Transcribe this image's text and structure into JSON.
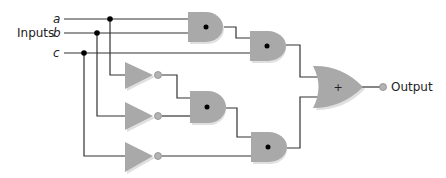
{
  "diagram": {
    "type": "logic-circuit",
    "inputs_label": "Inputs",
    "inputs": [
      {
        "name": "a",
        "label": "a"
      },
      {
        "name": "b",
        "label": "b"
      },
      {
        "name": "c",
        "label": "c"
      }
    ],
    "output_label": "Output",
    "gates": [
      {
        "id": "and1",
        "type": "AND",
        "symbol": "•",
        "inputs": [
          "a",
          "b"
        ]
      },
      {
        "id": "and2",
        "type": "AND",
        "symbol": "•",
        "inputs": [
          "and1",
          "c"
        ]
      },
      {
        "id": "not1",
        "type": "NOT",
        "inputs": [
          "a"
        ]
      },
      {
        "id": "not2",
        "type": "NOT",
        "inputs": [
          "b"
        ]
      },
      {
        "id": "not3",
        "type": "NOT",
        "inputs": [
          "c"
        ]
      },
      {
        "id": "and3",
        "type": "AND",
        "symbol": "•",
        "inputs": [
          "not1",
          "not2"
        ]
      },
      {
        "id": "and4",
        "type": "AND",
        "symbol": "•",
        "inputs": [
          "and3",
          "not3"
        ]
      },
      {
        "id": "or1",
        "type": "OR",
        "symbol": "+",
        "inputs": [
          "and2",
          "and4"
        ]
      }
    ],
    "or_symbol": "+",
    "colors": {
      "gate_fill": "#a9a9a9",
      "wire": "#333333",
      "junction": "#000000"
    }
  }
}
